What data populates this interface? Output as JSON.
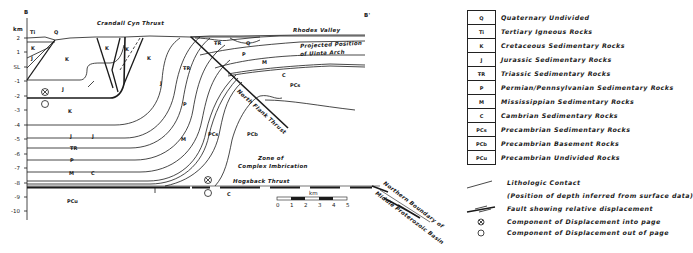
{
  "section": {
    "left_label": "B",
    "right_label": "B'",
    "depth_unit": "km",
    "depth_ticks": [
      "2",
      "1",
      "SL",
      "-1",
      "-2",
      "-3",
      "-4",
      "-5",
      "-6",
      "-7",
      "-8",
      "-9",
      "-10"
    ],
    "labels": {
      "crandall": "Crandall Cyn Thrust",
      "rhodes": "Rhodes Valley",
      "projected1": "Projected Position",
      "projected2": "of Uinta Arch",
      "north_flank": "North Flank Thrust",
      "zone1": "Zone of",
      "zone2": "Complex Imbrication",
      "hogsback": "Hogsback Thrust",
      "boundary1": "Northern Boundary of",
      "boundary2": "Middle Proterozoic Basin"
    },
    "unit_labels": {
      "Ti": "Ti",
      "Q": "Q",
      "K": "K",
      "J": "J",
      "TR": "Ŧ̅R",
      "P": "P",
      "M": "M",
      "C": "C",
      "PCs": "PCs",
      "PCb": "PCb",
      "PCu": "PCu"
    },
    "scale_bar": {
      "unit": "km",
      "ticks": [
        "0",
        "1",
        "2",
        "3",
        "4",
        "5"
      ]
    }
  },
  "legend": {
    "units": [
      {
        "symbol": "Q",
        "description": "Quaternary Undivided"
      },
      {
        "symbol": "Ti",
        "description": "Tertiary Igneous Rocks"
      },
      {
        "symbol": "K",
        "description": "Cretaceous Sedimentary Rocks"
      },
      {
        "symbol": "J",
        "description": "Jurassic Sedimentary Rocks"
      },
      {
        "symbol": "ŦR",
        "description": "Triassic Sedimentary Rocks"
      },
      {
        "symbol": "P",
        "description": "Permian/Pennsylvanian Sedimentary Rocks"
      },
      {
        "symbol": "M",
        "description": "Mississippian Sedimentary Rocks"
      },
      {
        "symbol": "C",
        "description": "Cambrian Sedimentary Rocks"
      },
      {
        "symbol": "PCs",
        "description": "Precambrian Sedimentary Rocks"
      },
      {
        "symbol": "PCb",
        "description": "Precambrian Basement Rocks"
      },
      {
        "symbol": "PCu",
        "description": "Precambrian Undivided Rocks"
      }
    ],
    "symbols": {
      "contact": "Lithologic Contact",
      "contact_note": "(Position of depth inferred from surface data)",
      "fault": "Fault showing relative displacement",
      "into_page": "Component of Displacement into page",
      "out_of_page": "Component of Displacement out of page"
    }
  }
}
